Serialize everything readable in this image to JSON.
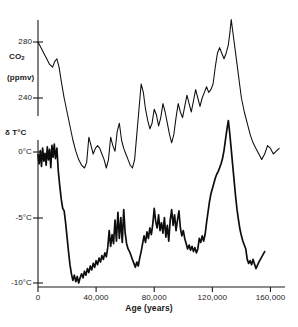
{
  "chart_data": {
    "type": "line",
    "title": "",
    "xlabel": "Age (years)",
    "xlim": [
      0,
      170000
    ],
    "xticks": [
      0,
      40000,
      80000,
      120000,
      160000
    ],
    "xticklabels": [
      "0",
      "40,000",
      "80,000",
      "120,000",
      "160,000"
    ],
    "grid": false,
    "legend": "none",
    "panels": [
      {
        "name": "co2-panel",
        "ylabel": "CO2",
        "yunits": "(ppmv)",
        "ylim": [
          175,
          300
        ],
        "yticks": [
          240,
          280
        ],
        "yticklabels": [
          "240",
          "280"
        ],
        "series": [
          {
            "name": "CO2",
            "x": [
              0,
              2000,
              4000,
              6000,
              8000,
              10000,
              11500,
              13000,
              14500,
              16000,
              18000,
              20000,
              22000,
              24000,
              26000,
              28000,
              30000,
              32000,
              33500,
              35000,
              36500,
              38000,
              39500,
              41000,
              42500,
              44000,
              45500,
              47000,
              48500,
              50000,
              51500,
              53000,
              54500,
              56000,
              57500,
              59000,
              60500,
              62000,
              63500,
              65000,
              66500,
              68000,
              69500,
              71000,
              72500,
              74000,
              75500,
              77000,
              78500,
              80000,
              81500,
              83000,
              84500,
              86000,
              87500,
              89000,
              90500,
              92000,
              93500,
              95000,
              96500,
              98000,
              99500,
              101000,
              102500,
              104000,
              105500,
              107000,
              108500,
              110000,
              111500,
              113000,
              114500,
              116000,
              117500,
              119000,
              120500,
              122000,
              123500,
              125000,
              126500,
              128000,
              129500,
              131000,
              132000,
              133000,
              134000,
              135500,
              137000,
              138500,
              140000,
              142000,
              144000,
              146000,
              148000,
              150000,
              152000,
              154000,
              156000,
              158000,
              160000,
              162000,
              164000,
              166000
            ],
            "y": [
              280,
              276,
              272,
              268,
              264,
              262,
              266,
              268,
              262,
              252,
              240,
              230,
              220,
              210,
              202,
              196,
              192,
              190,
              194,
              212,
              206,
              200,
              204,
              206,
              204,
              200,
              196,
              190,
              196,
              212,
              206,
              202,
              216,
              222,
              210,
              204,
              200,
              196,
              192,
              190,
              196,
              214,
              232,
              250,
              244,
              232,
              224,
              218,
              222,
              232,
              228,
              220,
              226,
              236,
              230,
              222,
              214,
              208,
              214,
              226,
              236,
              230,
              226,
              234,
              242,
              236,
              230,
              238,
              246,
              240,
              234,
              240,
              244,
              248,
              244,
              246,
              250,
              262,
              272,
              276,
              272,
              268,
              272,
              278,
              286,
              296,
              288,
              276,
              264,
              252,
              240,
              230,
              222,
              214,
              208,
              204,
              200,
              196,
              200,
              206,
              204,
              200,
              202,
              204
            ]
          }
        ]
      },
      {
        "name": "temperature-panel",
        "ylabel": "δ T°C",
        "ylim": [
          -11.5,
          3.0
        ],
        "yticks": [
          0,
          -5,
          -10
        ],
        "yticklabels": [
          "0°C",
          "-5°C",
          "-10°C"
        ],
        "series": [
          {
            "name": "delta-T",
            "x": [
              0,
              800,
              1600,
              2400,
              3200,
              4000,
              4800,
              5600,
              6400,
              7200,
              8000,
              8800,
              9600,
              10400,
              11200,
              12000,
              13000,
              14000,
              15000,
              16000,
              17000,
              18000,
              19000,
              20000,
              21000,
              22000,
              23000,
              24000,
              25000,
              26000,
              27000,
              28000,
              29000,
              30000,
              31000,
              32000,
              33000,
              34000,
              35000,
              36000,
              37000,
              38000,
              39000,
              40000,
              41000,
              42000,
              43000,
              44000,
              45000,
              46000,
              47000,
              48000,
              49000,
              50000,
              51000,
              52000,
              53000,
              54000,
              55000,
              56000,
              57000,
              58000,
              59000,
              60000,
              61000,
              62000,
              63000,
              64000,
              65000,
              66000,
              67000,
              68000,
              69000,
              70000,
              71000,
              72000,
              73000,
              74000,
              75000,
              76000,
              77000,
              78000,
              79000,
              80000,
              81000,
              82000,
              83000,
              84000,
              85000,
              86000,
              87000,
              88000,
              89000,
              90000,
              91000,
              92000,
              93000,
              94000,
              95000,
              96000,
              97000,
              98000,
              99000,
              100000,
              101000,
              102000,
              103000,
              104000,
              105000,
              106000,
              107000,
              108000,
              109000,
              110000,
              111000,
              112000,
              113000,
              114000,
              115000,
              116000,
              117000,
              118000,
              119000,
              120000,
              121000,
              122000,
              123000,
              124000,
              125000,
              126000,
              127000,
              128000,
              129000,
              130000,
              131000,
              132000,
              133000,
              134000,
              135000,
              136000,
              137000,
              138000,
              139000,
              140000,
              141000,
              142000,
              143000,
              144000,
              145000,
              146000,
              147000,
              148000,
              150000,
              152000,
              154000,
              156000,
              158000,
              160000,
              162000,
              164000,
              166000
            ],
            "y": [
              -0.2,
              -0.9,
              0.1,
              -1.1,
              0.3,
              -0.7,
              -0.1,
              -1.0,
              0.4,
              -0.6,
              0.2,
              -1.2,
              0.5,
              -0.4,
              0.6,
              -0.5,
              0.3,
              -1.5,
              -2.6,
              -3.6,
              -4.3,
              -4.5,
              -5.4,
              -6.5,
              -7.6,
              -8.6,
              -9.3,
              -9.8,
              -9.4,
              -9.9,
              -9.5,
              -10.0,
              -9.6,
              -9.3,
              -9.6,
              -9.1,
              -9.4,
              -8.9,
              -9.2,
              -8.7,
              -9.0,
              -8.5,
              -8.8,
              -8.3,
              -8.6,
              -8.1,
              -8.4,
              -7.9,
              -8.2,
              -7.7,
              -8.0,
              -7.3,
              -6.0,
              -7.2,
              -6.3,
              -7.0,
              -5.2,
              -6.8,
              -4.6,
              -6.6,
              -5.0,
              -6.9,
              -4.4,
              -6.2,
              -7.0,
              -7.4,
              -7.6,
              -7.9,
              -8.2,
              -8.5,
              -8.8,
              -8.4,
              -8.7,
              -8.1,
              -7.6,
              -7.0,
              -6.4,
              -6.9,
              -6.1,
              -6.6,
              -5.8,
              -6.3,
              -5.5,
              -4.3,
              -5.3,
              -5.8,
              -4.8,
              -6.0,
              -5.4,
              -6.2,
              -5.0,
              -6.5,
              -5.6,
              -6.8,
              -5.2,
              -4.4,
              -5.6,
              -4.8,
              -6.0,
              -5.2,
              -4.5,
              -5.8,
              -6.4,
              -6.0,
              -6.6,
              -7.0,
              -7.4,
              -7.1,
              -7.5,
              -7.2,
              -7.6,
              -7.3,
              -7.7,
              -7.4,
              -6.6,
              -6.9,
              -6.4,
              -6.8,
              -6.3,
              -5.4,
              -4.6,
              -3.8,
              -3.2,
              -2.8,
              -2.4,
              -2.0,
              -1.7,
              -1.5,
              -1.2,
              -0.9,
              -0.5,
              0.1,
              0.9,
              1.7,
              2.4,
              1.4,
              0.2,
              -1.0,
              -2.2,
              -3.4,
              -4.4,
              -5.2,
              -5.9,
              -6.4,
              -6.8,
              -7.1,
              -7.4,
              -8.2,
              -8.5,
              -8.3,
              -8.6,
              -8.2,
              -8.9,
              -8.4,
              -8.0,
              -7.6
            ]
          }
        ]
      }
    ]
  }
}
